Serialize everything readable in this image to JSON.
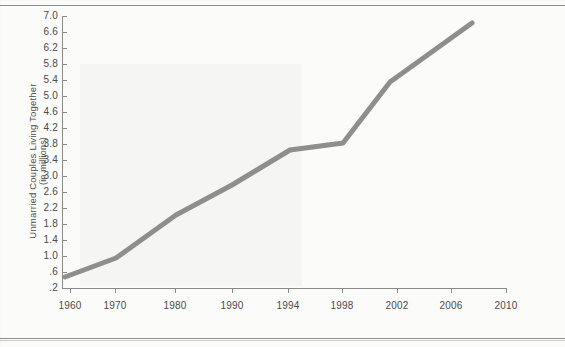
{
  "figure": {
    "ylabel_line1": "Unmarried Couples Living Together",
    "ylabel_line2": "(in millions)",
    "line_color": "#8e8e8e",
    "axis_color": "#8a8a8a",
    "background": "#fbfbfa"
  },
  "chart_data": {
    "type": "line",
    "title": "",
    "xlabel": "",
    "ylabel": "Unmarried Couples Living Together (in millions)",
    "grid": false,
    "legend": "none",
    "xlim": [
      1957,
      2010
    ],
    "ylim": [
      0.2,
      7.0
    ],
    "x_ticks": [
      1960,
      1970,
      1980,
      1990,
      1994,
      1998,
      2002,
      2006,
      2010
    ],
    "x_tick_labels": [
      "1960",
      "1970",
      "1980",
      "1990",
      "1994",
      "1998",
      "2002",
      "2006",
      "2010"
    ],
    "x_tick_px": [
      70,
      115,
      175,
      232,
      288,
      342,
      397,
      451,
      506
    ],
    "y_ticks": [
      7.0,
      6.6,
      6.2,
      5.8,
      5.4,
      5.0,
      4.6,
      4.2,
      3.8,
      3.4,
      3.0,
      2.6,
      2.2,
      1.8,
      1.4,
      1.0,
      0.6,
      0.2
    ],
    "y_tick_labels": [
      "7.0",
      "6.6",
      "6.2",
      "5.8",
      "5.4",
      "5.0",
      "4.6",
      "4.2",
      "3.8",
      "3.4",
      "3.0",
      "2.6",
      "2.2",
      "1.8",
      "1.4",
      "1.0",
      ".6",
      ".2"
    ],
    "y_tick_px": [
      16,
      32,
      48,
      64,
      80,
      96,
      112,
      128,
      144,
      160,
      176,
      192,
      208,
      224,
      240,
      256,
      272,
      288
    ],
    "series": [
      {
        "name": "Unmarried couples living together",
        "x": [
          1959,
          1970,
          1980,
          1990,
          1994,
          1998,
          2002,
          2008
        ],
        "y": [
          0.55,
          0.95,
          1.85,
          2.95,
          3.7,
          4.15,
          5.45,
          6.85
        ],
        "points_px": [
          [
            65,
            277
          ],
          [
            116,
            258
          ],
          [
            176,
            215
          ],
          [
            232,
            185
          ],
          [
            290,
            150
          ],
          [
            343,
            143
          ],
          [
            390,
            82
          ],
          [
            472,
            23
          ]
        ]
      }
    ]
  }
}
